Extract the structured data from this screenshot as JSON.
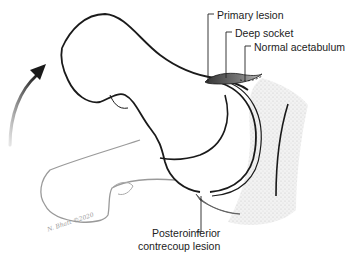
{
  "figure": {
    "type": "anatomical-illustration",
    "labels": {
      "primary_lesion": "Primary lesion",
      "deep_socket": "Deep socket",
      "normal_acetabulum": "Normal acetabulum",
      "posteroinferior_line1": "Posteroinferior",
      "posteroinferior_line2": "contrecoup lesion"
    },
    "signature": "N. Bhatt ©2020",
    "colors": {
      "outline": "#1a1a1a",
      "ghost_outline": "#9a9a9a",
      "stipple": "#d8d8d8",
      "lesion_shade": "#555555",
      "arrow_gradient_start": "#1a1a1a",
      "arrow_gradient_end": "#e0e0e0"
    },
    "arrow": {
      "direction": "up-right",
      "meaning": "rotation / flexion motion"
    }
  }
}
